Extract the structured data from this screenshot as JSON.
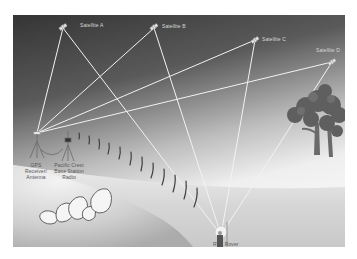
{
  "diagram": {
    "satellites": [
      {
        "label": "Satellite A"
      },
      {
        "label": "Satellite B"
      },
      {
        "label": "Satellite C"
      },
      {
        "label": "Satellite D"
      }
    ],
    "ground_labels": {
      "gps_receiver": "GPS Receiver/ Antenna",
      "base_radio": "Pacific Crest Base Station Radio",
      "rover": "RTK Rover"
    },
    "colors": {
      "sky_top": "#3a3a3a",
      "sky_bottom": "#f2f2f2",
      "ground": "#d9d9d9",
      "signal_line": "#f0f0f0",
      "radio_wave": "#444444",
      "tree_foliage": "#5e5e5e",
      "tree_trunk": "#6a6a6a",
      "rock": "#f4f4f4"
    }
  }
}
